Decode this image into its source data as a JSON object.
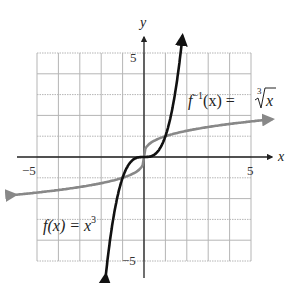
{
  "chart_data": {
    "type": "line",
    "title": "",
    "xlabel": "x",
    "ylabel": "y",
    "xlim": [
      -5,
      5
    ],
    "ylim": [
      -5,
      5
    ],
    "grid": true,
    "tick_labels": {
      "x_neg": "−5",
      "x_pos": "5",
      "y_pos": "5",
      "y_neg": "−5"
    },
    "series": [
      {
        "name": "f(x) = x^3",
        "label_parts": {
          "main": "f(x) = x",
          "sup": "3"
        },
        "color": "#111111",
        "x": [
          -1.78,
          -1.5,
          -1.25,
          -1,
          -0.75,
          -0.5,
          -0.25,
          0,
          0.25,
          0.5,
          0.75,
          1,
          1.25,
          1.5,
          1.8
        ],
        "y": [
          -5.64,
          -3.38,
          -1.95,
          -1,
          -0.42,
          -0.13,
          -0.02,
          0,
          0.02,
          0.13,
          0.42,
          1,
          1.95,
          3.38,
          5.83
        ]
      },
      {
        "name": "f^-1(x) = cbrt(x)",
        "label_parts": {
          "f": "f",
          "sup": "−1",
          "rest": "(x) = ",
          "root_index": "3",
          "radicand": "x"
        },
        "color": "#888888",
        "x": [
          -6,
          -5,
          -4,
          -3,
          -2,
          -1,
          -0.5,
          -0.1,
          0,
          0.1,
          0.5,
          1,
          2,
          3,
          4,
          5,
          6
        ],
        "y": [
          -1.82,
          -1.71,
          -1.59,
          -1.44,
          -1.26,
          -1,
          -0.79,
          -0.46,
          0,
          0.46,
          0.79,
          1,
          1.26,
          1.44,
          1.59,
          1.71,
          1.82
        ]
      }
    ]
  }
}
